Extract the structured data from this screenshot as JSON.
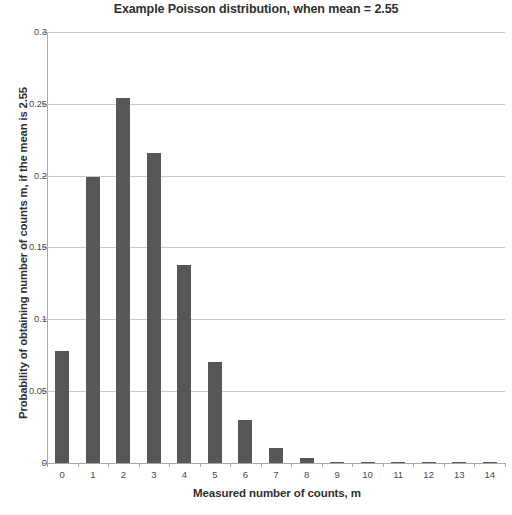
{
  "chart_data": {
    "type": "bar",
    "title": "Example Poisson distribution, when mean = 2.55",
    "xlabel": "Measured number of counts, m",
    "ylabel": "Probability of obtaining number of counts m, if the mean is 2.55",
    "categories": [
      "0",
      "1",
      "2",
      "3",
      "4",
      "5",
      "6",
      "7",
      "8",
      "9",
      "10",
      "11",
      "12",
      "13",
      "14"
    ],
    "values": [
      0.0781,
      0.1991,
      0.2539,
      0.2158,
      0.1376,
      0.0702,
      0.0298,
      0.0109,
      0.0035,
      0.001,
      0.0002,
      0.0001,
      0.0,
      0.0,
      0.0
    ],
    "ylim": [
      0,
      0.3
    ],
    "ytick_labels": [
      "0",
      "0.05",
      "0.1",
      "0.15",
      "0.2",
      "0.25",
      "0.3"
    ],
    "ytick_values": [
      0,
      0.05,
      0.1,
      0.15,
      0.2,
      0.25,
      0.3
    ],
    "grid": "horizontal",
    "legend": "none",
    "bar_color": "#575757",
    "gridline_color": "#c9c9c9",
    "axis_color": "#a8a8a8"
  }
}
